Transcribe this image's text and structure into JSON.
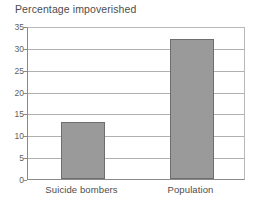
{
  "chart_data": {
    "type": "bar",
    "title": "Percentage impoverished",
    "xlabel": "",
    "ylabel": "",
    "categories": [
      "Suicide bombers",
      "Population"
    ],
    "values": [
      13,
      32
    ],
    "ylim": [
      0,
      35
    ],
    "yticks": [
      0,
      5,
      10,
      15,
      20,
      25,
      30,
      35
    ],
    "ytick_labels": [
      "0",
      "5",
      "10",
      "15",
      "20",
      "25",
      "30",
      "35"
    ],
    "grid": true,
    "legend": "none",
    "series": [
      {
        "name": "Percentage impoverished",
        "values": [
          13,
          32
        ]
      }
    ],
    "colors": {
      "bar_fill": "#9a9a9a",
      "bar_border": "#6e6e6e",
      "gridline": "#b0b0b0",
      "axis": "#8a8a8a",
      "text": "#4d4d4d",
      "background": "#ffffff"
    }
  }
}
